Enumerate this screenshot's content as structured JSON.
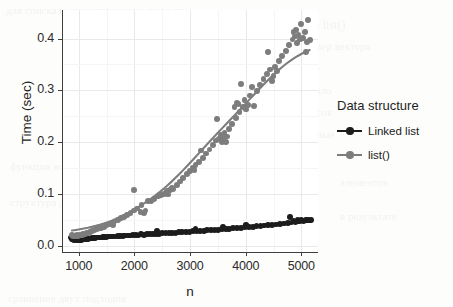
{
  "chart_data": {
    "type": "scatter",
    "title": "",
    "xlabel": "n",
    "ylabel": "Time (sec)",
    "xlim": [
      700,
      5300
    ],
    "ylim": [
      -0.012,
      0.455
    ],
    "xticks": [
      1000,
      2000,
      3000,
      4000,
      5000
    ],
    "xticklabels": [
      "1000",
      "2000",
      "3000",
      "4000",
      "5000"
    ],
    "yticks": [
      0.0,
      0.1,
      0.2,
      0.3,
      0.4
    ],
    "yticklabels": [
      "0.0",
      "0.1",
      "0.2",
      "0.3",
      "0.4"
    ],
    "grid": true,
    "legend_position": "right",
    "legend_title": "Data structure",
    "series": [
      {
        "name": "Linked list",
        "color": "#1c1c1c",
        "marker": "circle",
        "has_fit_line": true,
        "fit_shape": "linear",
        "points": [
          [
            860,
            0.016
          ],
          [
            880,
            0.013
          ],
          [
            900,
            0.012
          ],
          [
            915,
            0.011
          ],
          [
            930,
            0.013
          ],
          [
            945,
            0.012
          ],
          [
            960,
            0.011
          ],
          [
            975,
            0.012
          ],
          [
            990,
            0.01
          ],
          [
            1005,
            0.012
          ],
          [
            1020,
            0.011
          ],
          [
            1035,
            0.013
          ],
          [
            1050,
            0.011
          ],
          [
            1065,
            0.012
          ],
          [
            1080,
            0.012
          ],
          [
            1100,
            0.013
          ],
          [
            1120,
            0.012
          ],
          [
            1140,
            0.013
          ],
          [
            1165,
            0.013
          ],
          [
            1190,
            0.014
          ],
          [
            1215,
            0.014
          ],
          [
            1240,
            0.015
          ],
          [
            1270,
            0.015
          ],
          [
            1300,
            0.015
          ],
          [
            1330,
            0.016
          ],
          [
            1360,
            0.016
          ],
          [
            1395,
            0.016
          ],
          [
            1430,
            0.017
          ],
          [
            1465,
            0.017
          ],
          [
            1500,
            0.017
          ],
          [
            1540,
            0.018
          ],
          [
            1580,
            0.018
          ],
          [
            1620,
            0.018
          ],
          [
            1660,
            0.018
          ],
          [
            1700,
            0.019
          ],
          [
            1745,
            0.019
          ],
          [
            1790,
            0.019
          ],
          [
            1835,
            0.02
          ],
          [
            1880,
            0.02
          ],
          [
            1925,
            0.02
          ],
          [
            1975,
            0.021
          ],
          [
            2025,
            0.021
          ],
          [
            2075,
            0.02
          ],
          [
            2125,
            0.022
          ],
          [
            2175,
            0.021
          ],
          [
            2225,
            0.022
          ],
          [
            2280,
            0.022
          ],
          [
            2335,
            0.023
          ],
          [
            2390,
            0.022
          ],
          [
            2400,
            0.029
          ],
          [
            2445,
            0.023
          ],
          [
            2500,
            0.024
          ],
          [
            2560,
            0.024
          ],
          [
            2620,
            0.024
          ],
          [
            2680,
            0.025
          ],
          [
            2740,
            0.025
          ],
          [
            2800,
            0.026
          ],
          [
            2860,
            0.026
          ],
          [
            2925,
            0.027
          ],
          [
            2990,
            0.027
          ],
          [
            3050,
            0.028
          ],
          [
            3100,
            0.033
          ],
          [
            3115,
            0.028
          ],
          [
            3180,
            0.029
          ],
          [
            3245,
            0.029
          ],
          [
            3310,
            0.03
          ],
          [
            3375,
            0.03
          ],
          [
            3440,
            0.031
          ],
          [
            3505,
            0.031
          ],
          [
            3570,
            0.032
          ],
          [
            3600,
            0.037
          ],
          [
            3640,
            0.032
          ],
          [
            3705,
            0.033
          ],
          [
            3775,
            0.034
          ],
          [
            3845,
            0.034
          ],
          [
            3915,
            0.035
          ],
          [
            3985,
            0.036
          ],
          [
            4010,
            0.041
          ],
          [
            4055,
            0.036
          ],
          [
            4125,
            0.037
          ],
          [
            4195,
            0.038
          ],
          [
            4265,
            0.038
          ],
          [
            4335,
            0.039
          ],
          [
            4405,
            0.04
          ],
          [
            4475,
            0.04
          ],
          [
            4545,
            0.041
          ],
          [
            4615,
            0.042
          ],
          [
            4685,
            0.043
          ],
          [
            4755,
            0.044
          ],
          [
            4800,
            0.055
          ],
          [
            4825,
            0.045
          ],
          [
            4860,
            0.048
          ],
          [
            4895,
            0.046
          ],
          [
            4930,
            0.05
          ],
          [
            4965,
            0.047
          ],
          [
            5000,
            0.049
          ],
          [
            5040,
            0.048
          ],
          [
            5080,
            0.05
          ],
          [
            5120,
            0.049
          ],
          [
            5175,
            0.05
          ]
        ]
      },
      {
        "name": "list()",
        "color": "#7d7d7d",
        "marker": "circle",
        "has_fit_line": true,
        "fit_shape": "quadratic",
        "points": [
          [
            880,
            0.021
          ],
          [
            900,
            0.019
          ],
          [
            920,
            0.02
          ],
          [
            945,
            0.018
          ],
          [
            965,
            0.021
          ],
          [
            985,
            0.019
          ],
          [
            1005,
            0.02
          ],
          [
            1030,
            0.021
          ],
          [
            1055,
            0.02
          ],
          [
            1080,
            0.022
          ],
          [
            1110,
            0.022
          ],
          [
            1140,
            0.024
          ],
          [
            1175,
            0.025
          ],
          [
            1210,
            0.027
          ],
          [
            1245,
            0.028
          ],
          [
            1285,
            0.031
          ],
          [
            1325,
            0.033
          ],
          [
            1365,
            0.034
          ],
          [
            1405,
            0.034
          ],
          [
            1450,
            0.037
          ],
          [
            1495,
            0.039
          ],
          [
            1540,
            0.041
          ],
          [
            1590,
            0.043
          ],
          [
            1620,
            0.04
          ],
          [
            1645,
            0.047
          ],
          [
            1700,
            0.05
          ],
          [
            1755,
            0.053
          ],
          [
            1810,
            0.056
          ],
          [
            1870,
            0.06
          ],
          [
            1930,
            0.064
          ],
          [
            1990,
            0.068
          ],
          [
            2000,
            0.107
          ],
          [
            2050,
            0.072
          ],
          [
            2110,
            0.065
          ],
          [
            2130,
            0.078
          ],
          [
            2180,
            0.064
          ],
          [
            2200,
            0.068
          ],
          [
            2250,
            0.086
          ],
          [
            2300,
            0.086
          ],
          [
            2360,
            0.091
          ],
          [
            2420,
            0.095
          ],
          [
            2480,
            0.098
          ],
          [
            2530,
            0.1
          ],
          [
            2580,
            0.105
          ],
          [
            2600,
            0.099
          ],
          [
            2640,
            0.108
          ],
          [
            2670,
            0.111
          ],
          [
            2700,
            0.11
          ],
          [
            2760,
            0.118
          ],
          [
            2820,
            0.124
          ],
          [
            2880,
            0.131
          ],
          [
            2940,
            0.138
          ],
          [
            3000,
            0.145
          ],
          [
            3050,
            0.151
          ],
          [
            3080,
            0.147
          ],
          [
            3100,
            0.156
          ],
          [
            3160,
            0.162
          ],
          [
            3200,
            0.184
          ],
          [
            3230,
            0.17
          ],
          [
            3290,
            0.178
          ],
          [
            3350,
            0.186
          ],
          [
            3410,
            0.195
          ],
          [
            3470,
            0.203
          ],
          [
            3480,
            0.245
          ],
          [
            3520,
            0.206
          ],
          [
            3550,
            0.214
          ],
          [
            3570,
            0.2
          ],
          [
            3600,
            0.208
          ],
          [
            3620,
            0.218
          ],
          [
            3650,
            0.201
          ],
          [
            3670,
            0.211
          ],
          [
            3700,
            0.225
          ],
          [
            3760,
            0.235
          ],
          [
            3800,
            0.268
          ],
          [
            3830,
            0.246
          ],
          [
            3850,
            0.276
          ],
          [
            3870,
            0.273
          ],
          [
            3890,
            0.258
          ],
          [
            3920,
            0.312
          ],
          [
            3950,
            0.268
          ],
          [
            3980,
            0.281
          ],
          [
            4010,
            0.263
          ],
          [
            4040,
            0.272
          ],
          [
            4080,
            0.29
          ],
          [
            4120,
            0.307
          ],
          [
            4150,
            0.269
          ],
          [
            4200,
            0.299
          ],
          [
            4260,
            0.31
          ],
          [
            4320,
            0.322
          ],
          [
            4380,
            0.331
          ],
          [
            4400,
            0.374
          ],
          [
            4440,
            0.34
          ],
          [
            4470,
            0.318
          ],
          [
            4500,
            0.327
          ],
          [
            4530,
            0.345
          ],
          [
            4560,
            0.338
          ],
          [
            4600,
            0.356
          ],
          [
            4660,
            0.366
          ],
          [
            4720,
            0.376
          ],
          [
            4780,
            0.387
          ],
          [
            4840,
            0.398
          ],
          [
            4860,
            0.412
          ],
          [
            4880,
            0.404
          ],
          [
            4900,
            0.416
          ],
          [
            4920,
            0.392
          ],
          [
            4950,
            0.406
          ],
          [
            4980,
            0.398
          ],
          [
            5000,
            0.428
          ],
          [
            5030,
            0.401
          ],
          [
            5060,
            0.412
          ],
          [
            5080,
            0.374
          ],
          [
            5100,
            0.393
          ],
          [
            5120,
            0.436
          ],
          [
            5150,
            0.397
          ]
        ]
      }
    ]
  },
  "axis": {
    "xlabel": "n",
    "ylabel": "Time (sec)"
  },
  "legend": {
    "title": "Data structure",
    "entries": [
      {
        "label": "Linked list",
        "color": "#1c1c1c"
      },
      {
        "label": "list()",
        "color": "#7d7d7d"
      }
    ]
  },
  "background_artifacts": [
    {
      "text": "для списка и связного",
      "x": 6,
      "y": 4,
      "size": 11
    },
    {
      "text": "p <- list()",
      "x": 300,
      "y": 18,
      "size": 12
    },
    {
      "text": "размер вектора",
      "x": 300,
      "y": 40,
      "size": 11
    },
    {
      "text": "time",
      "x": 300,
      "y": 62,
      "size": 11
    },
    {
      "text": "начало",
      "x": 300,
      "y": 84,
      "size": 11
    },
    {
      "text": "список",
      "x": 300,
      "y": 106,
      "size": 11
    },
    {
      "text": "данные",
      "x": 300,
      "y": 128,
      "size": 11
    },
    {
      "text": "проверка скорости",
      "x": 100,
      "y": 4,
      "size": 11
    },
    {
      "text": "время работы",
      "x": 150,
      "y": 60,
      "size": 11
    },
    {
      "text": "функция возвращает",
      "x": 10,
      "y": 160,
      "size": 11
    },
    {
      "text": "структура данных",
      "x": 10,
      "y": 196,
      "size": 11
    },
    {
      "text": "элементов",
      "x": 340,
      "y": 176,
      "size": 11
    },
    {
      "text": "в результате",
      "x": 340,
      "y": 210,
      "size": 11
    },
    {
      "text": "сравнение двух подходов",
      "x": 8,
      "y": 292,
      "size": 11
    }
  ]
}
